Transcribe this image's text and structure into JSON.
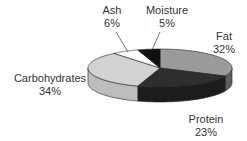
{
  "chart_data": {
    "type": "pie",
    "style": "3d",
    "title": "",
    "slices": [
      {
        "label": "Fat",
        "value": 32,
        "display": "32%",
        "color": "#9a9a9a",
        "side_color": "#5e5e5e"
      },
      {
        "label": "Protein",
        "value": 23,
        "display": "23%",
        "color": "#2e2e2e",
        "side_color": "#1c1c1c"
      },
      {
        "label": "Carbohydrates",
        "value": 34,
        "display": "34%",
        "color": "#d2d2d2",
        "side_color": "#bdbdbd"
      },
      {
        "label": "Ash",
        "value": 6,
        "display": "6%",
        "color": "#ffffff",
        "side_color": "#e6e6e6"
      },
      {
        "label": "Moisture",
        "value": 5,
        "display": "5%",
        "color": "#111111",
        "side_color": "#000000"
      }
    ],
    "legend": "none (direct labels)",
    "start_angle": "top, clockwise"
  },
  "labels": {
    "fat": {
      "name": "Fat",
      "pct": "32%"
    },
    "protein": {
      "name": "Protein",
      "pct": "23%"
    },
    "carbohydrates": {
      "name": "Carbohydrates",
      "pct": "34%"
    },
    "ash": {
      "name": "Ash",
      "pct": "6%"
    },
    "moisture": {
      "name": "Moisture",
      "pct": "5%"
    }
  }
}
